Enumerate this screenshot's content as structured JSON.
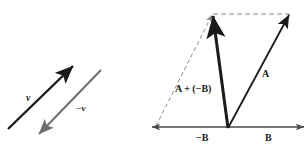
{
  "figure": {
    "background": "#ffffff",
    "width": 308,
    "height": 154,
    "colors": {
      "dark": "#1a1a1a",
      "gray": "#6f6f6f",
      "dashed": "#8a8a8a",
      "axis": "#4a4a4a"
    }
  },
  "left_panel": {
    "name": "vector-negation",
    "vectors": [
      {
        "id": "v",
        "label": "v",
        "label_x": 26,
        "label_y": 101,
        "x1": 8,
        "y1": 129,
        "x2": 73,
        "y2": 66,
        "color": "#1a1a1a",
        "width": 2.4,
        "arrow": "end"
      },
      {
        "id": "minus-v",
        "label": "−v",
        "label_x": 76,
        "label_y": 111,
        "x1": 101,
        "y1": 70,
        "x2": 39,
        "y2": 134,
        "color": "#6f6f6f",
        "width": 2.0,
        "arrow": "end"
      }
    ]
  },
  "right_panel": {
    "name": "vector-subtraction-parallelogram",
    "origin": {
      "x": 228,
      "y": 128
    },
    "axis": {
      "name": "horizontal-axis",
      "x1": 152,
      "y1": 127,
      "x2": 304,
      "y2": 127,
      "color": "#4a4a4a",
      "arrow": "both"
    },
    "axis_labels": [
      {
        "id": "minus-B",
        "label": "−B",
        "x": 196,
        "y": 141
      },
      {
        "id": "B",
        "label": "B",
        "x": 265,
        "y": 141
      }
    ],
    "vectors": [
      {
        "id": "resultant",
        "label": "A + (−B)",
        "label_x": 175,
        "label_y": 92,
        "x1": 228,
        "y1": 128,
        "x2": 213,
        "y2": 16,
        "color": "#1a1a1a",
        "width": 3.0,
        "arrow": "end"
      },
      {
        "id": "A",
        "label": "A",
        "label_x": 262,
        "label_y": 77,
        "x1": 228,
        "y1": 128,
        "x2": 289,
        "y2": 15,
        "color": "#1a1a1a",
        "width": 1.8,
        "arrow": "end"
      }
    ],
    "construction_lines": [
      {
        "id": "dashed-left-diagonal",
        "x1": 156,
        "y1": 126,
        "x2": 212,
        "y2": 15,
        "dash": "4 3",
        "color": "#8a8a8a",
        "width": 1.0
      },
      {
        "id": "dashed-top-edge",
        "x1": 213,
        "y1": 14,
        "x2": 290,
        "y2": 14,
        "dash": "5 3",
        "color": "#8a8a8a",
        "width": 1.0
      }
    ]
  }
}
